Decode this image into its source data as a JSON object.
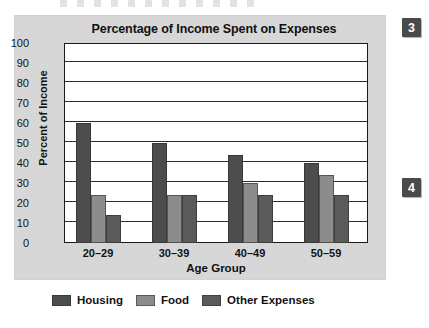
{
  "chart_data": {
    "type": "bar",
    "title": "Percentage of Income Spent on Expenses",
    "xlabel": "Age Group",
    "ylabel": "Percent of Income",
    "categories": [
      "20–29",
      "30–39",
      "40–49",
      "50–59"
    ],
    "series": [
      {
        "name": "Housing",
        "values": [
          60,
          50,
          44,
          40
        ],
        "color": "#4d4d4d"
      },
      {
        "name": "Food",
        "values": [
          24,
          24,
          30,
          34
        ],
        "color": "#8c8c8c"
      },
      {
        "name": "Other Expenses",
        "values": [
          14,
          24,
          24,
          24
        ],
        "color": "#5a5a5a"
      }
    ],
    "ylim": [
      0,
      100
    ],
    "yticks": [
      0,
      10,
      20,
      30,
      40,
      50,
      60,
      70,
      80,
      90,
      100
    ],
    "ytick_labels": [
      "0",
      "10",
      "20",
      "30",
      "40",
      "50",
      "60",
      "70",
      "80",
      "90",
      "100"
    ],
    "grid": true,
    "legend_position": "bottom"
  },
  "panel": {
    "background_color": "#d7d7d7",
    "plot_background_color": "#ffffff",
    "axis_color": "#1a1a1a"
  },
  "margin_badges": [
    {
      "label": "3",
      "color": "#4a4a4a"
    },
    {
      "label": "4",
      "color": "#4a4a4a"
    }
  ]
}
